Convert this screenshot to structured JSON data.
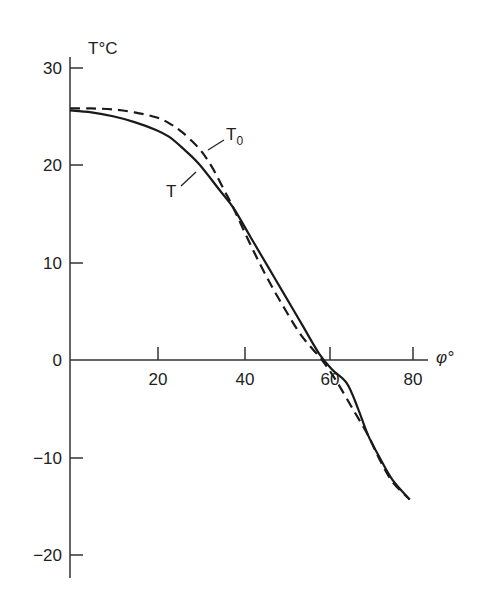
{
  "chart_data": {
    "type": "line",
    "title": "",
    "xlabel": "φ°",
    "ylabel": "T°C",
    "xlim": [
      0,
      80
    ],
    "ylim": [
      -22,
      30
    ],
    "xticks": [
      20,
      40,
      60,
      80
    ],
    "yticks": [
      30,
      20,
      10,
      0,
      -10,
      -20
    ],
    "grid": false,
    "legend": "inline labels",
    "series": [
      {
        "name": "T",
        "style": "solid",
        "x": [
          0,
          5,
          10,
          15,
          20,
          23,
          26,
          30,
          35,
          38,
          42,
          46,
          50,
          54,
          58,
          61,
          64.4,
          67,
          69.3,
          72,
          75,
          79
        ],
        "y": [
          25.6,
          25.4,
          25.0,
          24.4,
          23.6,
          22.9,
          21.8,
          20.1,
          17.3,
          15.6,
          12.6,
          9.6,
          6.6,
          3.6,
          0.6,
          -1.0,
          -2.4,
          -5.0,
          -7.7,
          -10.0,
          -12.3,
          -14.3
        ]
      },
      {
        "name": "T0",
        "style": "dashed",
        "x": [
          0,
          5,
          10,
          15,
          20,
          23,
          26,
          30,
          33,
          36,
          38,
          42,
          46,
          50,
          54,
          58.6,
          62,
          66,
          69.3,
          72,
          75,
          79
        ],
        "y": [
          25.8,
          25.8,
          25.7,
          25.4,
          24.9,
          24.3,
          23.4,
          21.7,
          19.8,
          17.3,
          15.6,
          11.8,
          8.3,
          5.2,
          2.4,
          0,
          -2.2,
          -5.2,
          -7.7,
          -10.2,
          -12.5,
          -14.3
        ]
      }
    ],
    "annotations": [
      {
        "text": "T",
        "sub": "0",
        "near": "dashed curve at φ≈30°"
      },
      {
        "text": "T",
        "near": "solid curve at φ≈27°"
      }
    ]
  },
  "labels": {
    "y_axis_title": "T°C",
    "x_axis_title": "φ°",
    "y_ticks": [
      "30",
      "20",
      "10",
      "0",
      "−10",
      "−20"
    ],
    "x_ticks": [
      "20",
      "40",
      "60",
      "80"
    ],
    "curve_T": "T",
    "curve_T0_main": "T",
    "curve_T0_sub": "0"
  }
}
